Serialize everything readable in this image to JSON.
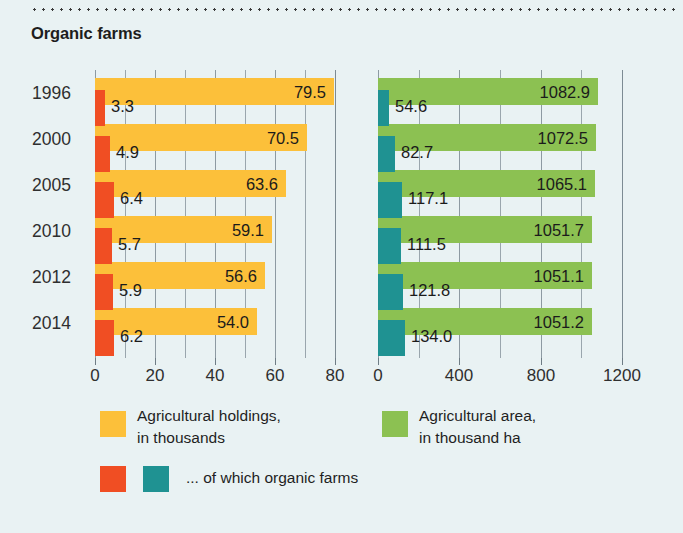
{
  "title": "Organic farms",
  "colors": {
    "background": "#e9f2f3",
    "holdings_total": "#fcc03a",
    "holdings_organic": "#f04e23",
    "area_total": "#8cc152",
    "area_organic": "#1f9292",
    "gridline": "#9aa6ad",
    "text": "#2b2b2b"
  },
  "years": [
    "1996",
    "2000",
    "2005",
    "2010",
    "2012",
    "2014"
  ],
  "left_axis": {
    "ticks": [
      "0",
      "20",
      "40",
      "60",
      "80"
    ],
    "min": 0,
    "max": 80,
    "gridstep": 10
  },
  "right_axis": {
    "ticks": [
      "0",
      "400",
      "800",
      "1200"
    ],
    "min": 0,
    "max": 1200,
    "gridstep": 200
  },
  "left_values_total": [
    "79.5",
    "70.5",
    "63.6",
    "59.1",
    "56.6",
    "54.0"
  ],
  "left_values_organic": [
    "3.3",
    "4.9",
    "6.4",
    "5.7",
    "5.9",
    "6.2"
  ],
  "right_values_total": [
    "1082.9",
    "1072.5",
    "1065.1",
    "1051.7",
    "1051.1",
    "1051.2"
  ],
  "right_values_organic": [
    "54.6",
    "82.7",
    "117.1",
    "111.5",
    "121.8",
    "134.0"
  ],
  "legend": {
    "holdings_line1": "Agricultural holdings,",
    "holdings_line2": "in thousands",
    "area_line1": "Agricultural area,",
    "area_line2": "in thousand ha",
    "organic_note": "... of which organic farms"
  },
  "chart_data": {
    "type": "bar",
    "title": "Organic farms",
    "orientation": "horizontal",
    "categories": [
      "1996",
      "2000",
      "2005",
      "2010",
      "2012",
      "2014"
    ],
    "panels": [
      {
        "name": "Agricultural holdings, in thousands",
        "xlabel": "",
        "ylabel": "",
        "xlim": [
          0,
          80
        ],
        "xticks": [
          0,
          20,
          40,
          60,
          80
        ],
        "gridstep": 10,
        "grid": true,
        "series": [
          {
            "name": "Agricultural holdings, in thousands",
            "color": "#fcc03a",
            "values": [
              79.5,
              70.5,
              63.6,
              59.1,
              56.6,
              54.0
            ]
          },
          {
            "name": "... of which organic farms",
            "color": "#f04e23",
            "values": [
              3.3,
              4.9,
              6.4,
              5.7,
              5.9,
              6.2
            ]
          }
        ]
      },
      {
        "name": "Agricultural area, in thousand ha",
        "xlabel": "",
        "ylabel": "",
        "xlim": [
          0,
          1200
        ],
        "xticks": [
          0,
          400,
          800,
          1200
        ],
        "gridstep": 200,
        "grid": true,
        "series": [
          {
            "name": "Agricultural area, in thousand ha",
            "color": "#8cc152",
            "values": [
              1082.9,
              1072.5,
              1065.1,
              1051.7,
              1051.1,
              1051.2
            ]
          },
          {
            "name": "... of which organic farms",
            "color": "#1f9292",
            "values": [
              54.6,
              82.7,
              117.1,
              111.5,
              121.8,
              134.0
            ]
          }
        ]
      }
    ],
    "legend_position": "bottom"
  }
}
